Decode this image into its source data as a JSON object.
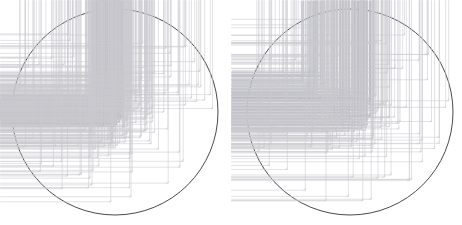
{
  "figure": {
    "title": "",
    "background_color": "#ffffff",
    "width": 462,
    "height": 225,
    "panel_count": 2
  },
  "chart_data": {
    "type": "scatter",
    "title": "",
    "subtitle": "",
    "xlabel": "",
    "ylabel": "",
    "xlim": [
      -1,
      1
    ],
    "ylim": [
      -1,
      1
    ],
    "grid": false,
    "legend": null,
    "projection": "equal-area circular (stereonet / pole figure)",
    "marker": {
      "shape": "plus",
      "size_px": 2.2,
      "color": "#c9c9cf",
      "core_color": "#b9b9c2"
    },
    "boundary": {
      "shape": "circle",
      "stroke": "#4a4a4a",
      "stroke_width_px": 1
    },
    "panels": [
      {
        "name": "panel-left",
        "center_px": [
          115,
          112
        ],
        "radius_px": 103,
        "point_count": 612,
        "clusters": [
          {
            "name": "dense-core",
            "center": [
              -0.07,
              0.01
            ],
            "radius": 0.16,
            "count": 300,
            "density": "very high"
          },
          {
            "name": "mid-halo",
            "center": [
              -0.02,
              0.02
            ],
            "radius": 0.4,
            "count": 190,
            "density": "medium"
          },
          {
            "name": "outer-scatter",
            "center": [
              0.0,
              0.0
            ],
            "radius": 0.98,
            "count": 122,
            "density": "low"
          }
        ]
      },
      {
        "name": "panel-right",
        "center_px": [
          350,
          112
        ],
        "radius_px": 103,
        "point_count": 468,
        "clusters": [
          {
            "name": "dense-core",
            "center": [
              0.02,
              0.02
            ],
            "radius": 0.22,
            "count": 180,
            "density": "high"
          },
          {
            "name": "secondary-cluster",
            "center": [
              -0.35,
              0.28
            ],
            "radius": 0.13,
            "count": 45,
            "density": "high"
          },
          {
            "name": "mid-halo",
            "center": [
              0.0,
              -0.05
            ],
            "radius": 0.45,
            "count": 120,
            "density": "medium"
          },
          {
            "name": "outer-scatter",
            "center": [
              0.0,
              0.0
            ],
            "radius": 0.98,
            "count": 123,
            "density": "low"
          }
        ]
      }
    ]
  }
}
